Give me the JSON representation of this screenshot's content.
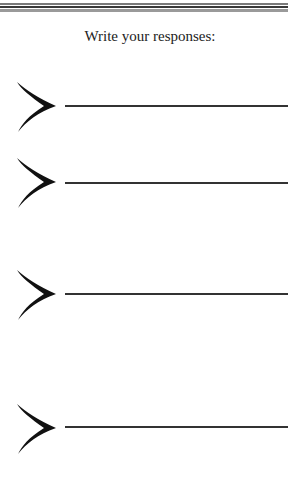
{
  "heading": "Write your responses:",
  "responses": [
    {
      "index": 1,
      "value": ""
    },
    {
      "index": 2,
      "value": ""
    },
    {
      "index": 3,
      "value": ""
    },
    {
      "index": 4,
      "value": ""
    }
  ],
  "icons": {
    "bullet": "chevron-right-icon"
  },
  "colors": {
    "ink": "#111111",
    "rule": "#333333"
  }
}
